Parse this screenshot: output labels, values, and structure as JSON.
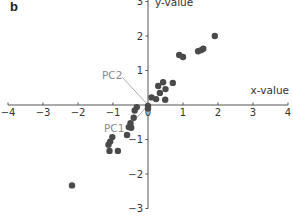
{
  "panel_label": "b",
  "chart_data": {
    "type": "scatter",
    "title": "",
    "xlabel": "x-value",
    "ylabel": "y-value",
    "xlim": [
      -4,
      4
    ],
    "ylim": [
      -3,
      3
    ],
    "x_ticks": [
      -4,
      -3,
      -2,
      -1,
      0,
      1,
      2,
      3,
      4
    ],
    "y_ticks": [
      -3,
      -2,
      -1,
      0,
      1,
      2,
      3
    ],
    "grid": false,
    "legend": null,
    "point_color": "#4a4a4a",
    "annotations": [
      {
        "text": "PC1",
        "x": -0.9,
        "y": -0.55,
        "line_to": [
          0,
          0
        ],
        "color": "#8a8a8a"
      },
      {
        "text": "PC2",
        "x": -0.85,
        "y": 0.9,
        "line_to": [
          0,
          0
        ],
        "color": "#8a8a8a"
      }
    ],
    "series": [
      {
        "name": "data",
        "points": [
          [
            1.91,
            2.0
          ],
          [
            1.58,
            1.63
          ],
          [
            1.52,
            1.59
          ],
          [
            1.43,
            1.56
          ],
          [
            0.89,
            1.45
          ],
          [
            1.0,
            1.39
          ],
          [
            0.43,
            0.66
          ],
          [
            0.29,
            0.55
          ],
          [
            0.71,
            0.64
          ],
          [
            0.5,
            0.46
          ],
          [
            0.34,
            0.35
          ],
          [
            0.49,
            0.15
          ],
          [
            0.1,
            0.22
          ],
          [
            0.23,
            0.17
          ],
          [
            0.0,
            -0.03
          ],
          [
            0.0,
            -0.1
          ],
          [
            -0.32,
            -0.06
          ],
          [
            -0.38,
            -0.16
          ],
          [
            -0.41,
            -0.37
          ],
          [
            -0.5,
            -0.53
          ],
          [
            -0.55,
            -0.64
          ],
          [
            -0.48,
            -0.66
          ],
          [
            -0.6,
            -0.87
          ],
          [
            -1.02,
            -0.93
          ],
          [
            -1.08,
            -1.06
          ],
          [
            -1.13,
            -1.15
          ],
          [
            -1.1,
            -1.33
          ],
          [
            -0.86,
            -1.33
          ],
          [
            -2.17,
            -2.33
          ]
        ]
      }
    ]
  }
}
